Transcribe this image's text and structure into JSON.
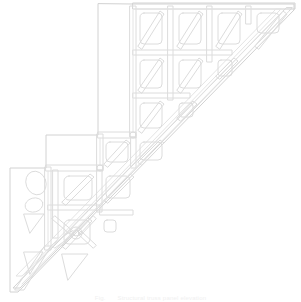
{
  "figure": {
    "drawing_type": "technical line drawing",
    "view": "elevation",
    "line_color": "#dcdcdc",
    "background_color": "#ffffff",
    "caption_label": "Fig.",
    "caption_text": "Structural truss panel elevation"
  },
  "geometry": {
    "canvas": {
      "width": 301,
      "height": 302
    },
    "outline_description": "Right triangle with stepped upper-left staircase profile, horizontal top chord, and long diagonal bottom chord running from lower-left apex to upper-right corner.",
    "top_chord_y": 6,
    "left_vertical_x": 133,
    "apex_point": {
      "x": 14,
      "y": 290
    },
    "top_right_point": {
      "x": 292,
      "y": 6
    },
    "steps": [
      {
        "x": 133,
        "y_top": 6,
        "y_bottom": 133
      },
      {
        "x": 100,
        "y_top": 133,
        "y_bottom": 166
      },
      {
        "x": 48,
        "y_top": 166,
        "y_bottom": 244
      }
    ],
    "cell_count": 14,
    "brace_style": "single diagonal per cell; X-brace with circular node in lower-left cell",
    "node_circles": 2
  },
  "legend": {
    "items": []
  }
}
